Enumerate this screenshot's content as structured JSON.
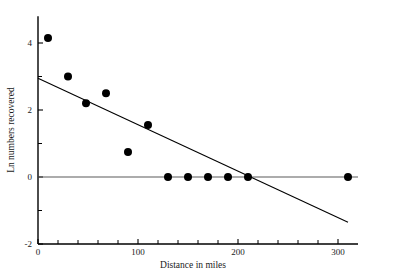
{
  "chart_data": {
    "type": "scatter",
    "title": "",
    "xlabel": "Distance in miles",
    "ylabel": "Ln numbers recovered",
    "xlim": [
      0,
      320
    ],
    "ylim": [
      -2,
      4.8
    ],
    "grid": false,
    "legend": null,
    "x_ticks_major": [
      0,
      100,
      200,
      300
    ],
    "x_tick_labels": [
      "0",
      "100",
      "200",
      "300"
    ],
    "x_ticks_minor": [
      20,
      40,
      60,
      80,
      120,
      140,
      160,
      180,
      220,
      240,
      260,
      280
    ],
    "y_ticks_major": [
      -2,
      0,
      2,
      4
    ],
    "y_tick_labels": [
      "-2",
      "0",
      "2",
      "4"
    ],
    "y_ticks_minor": [
      -1,
      1,
      3
    ],
    "points": [
      {
        "x": 10,
        "y": 4.15
      },
      {
        "x": 30,
        "y": 3.0
      },
      {
        "x": 48,
        "y": 2.2
      },
      {
        "x": 68,
        "y": 2.5
      },
      {
        "x": 90,
        "y": 0.75
      },
      {
        "x": 110,
        "y": 1.55
      },
      {
        "x": 130,
        "y": 0.0
      },
      {
        "x": 150,
        "y": 0.0
      },
      {
        "x": 170,
        "y": 0.0
      },
      {
        "x": 190,
        "y": 0.0
      },
      {
        "x": 210,
        "y": 0.0
      },
      {
        "x": 310,
        "y": 0.0
      }
    ],
    "point_marker": "filled-circle",
    "point_radius_px": 4,
    "fit_line": {
      "name": "regression-line",
      "x_start": 0,
      "y_start": 2.95,
      "x_end": 310,
      "y_end": -1.35,
      "color": "#000000"
    },
    "reference_line": {
      "name": "zero-line",
      "y": 0,
      "x_start": 0,
      "x_end": 320,
      "color": "#5a5a5a"
    }
  },
  "axes": {
    "x_title": "Distance in miles",
    "y_title": "Ln numbers recovered"
  }
}
